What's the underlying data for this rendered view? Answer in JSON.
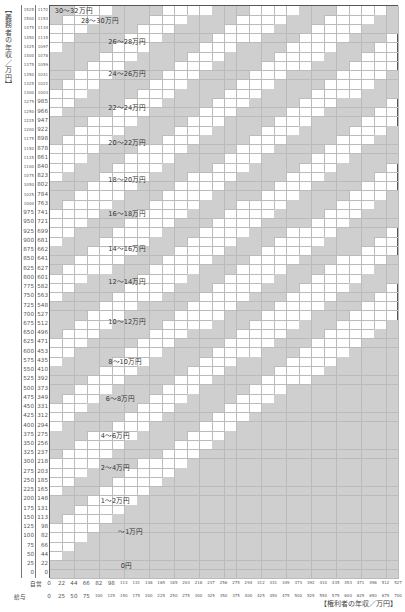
{
  "chart_data": {
    "type": "heatmap",
    "ylabel": "【義務者の年収／万円】",
    "xlabel": "【権利者の年収／万円】",
    "y_axis": {
      "salary_label": "給与",
      "self_employed_label": "自営",
      "salary_values": [
        2000,
        1975,
        1950,
        1925,
        1900,
        1875,
        1850,
        1825,
        1800,
        1775,
        1750,
        1725,
        1700,
        1675,
        1650,
        1625,
        1600,
        1575,
        1550,
        1525,
        1500,
        1475,
        1450,
        1425,
        1400,
        1375,
        1350,
        1325,
        1300,
        1275,
        1250,
        1225,
        1200,
        1175,
        1150,
        1125,
        1100,
        1075,
        1050,
        1025,
        1000,
        975,
        950,
        925,
        900,
        875,
        850,
        825,
        800,
        775,
        750,
        725,
        700,
        675,
        650,
        625,
        600,
        575,
        550,
        525,
        500,
        475,
        450,
        425,
        400,
        375,
        350,
        325,
        300,
        275,
        250,
        225,
        200,
        175,
        150,
        125,
        100,
        75,
        50,
        25,
        0
      ],
      "self_employed_values": [
        1567,
        1548,
        1530,
        1511,
        1492,
        1473,
        1455,
        1436,
        1417,
        1398,
        1379,
        1360,
        1342,
        1323,
        1304,
        1285,
        1266,
        1247,
        1229,
        1210,
        1191,
        1172,
        1153,
        1134,
        1115,
        1097,
        1078,
        1059,
        1041,
        1022,
        1003,
        985,
        966,
        947,
        922,
        898,
        878,
        861,
        840,
        823,
        802,
        784,
        763,
        741,
        721,
        699,
        681,
        662,
        641,
        627,
        601,
        582,
        563,
        548,
        527,
        512,
        496,
        471,
        453,
        435,
        410,
        392,
        373,
        349,
        331,
        312,
        294,
        275,
        256,
        237,
        218,
        203,
        185,
        165,
        148,
        131,
        113,
        98,
        82,
        66,
        44,
        22,
        0
      ]
    },
    "x_axis": {
      "self_employed_label": "自営",
      "salary_label": "給与",
      "self_employed_values": [
        0,
        22,
        44,
        66,
        82,
        98,
        113,
        131,
        148,
        165,
        185,
        203,
        218,
        237,
        256,
        275,
        294,
        312,
        331,
        349,
        373,
        392,
        410,
        435,
        453,
        471,
        496,
        512,
        527
      ],
      "salary_values": [
        0,
        25,
        50,
        75,
        100,
        125,
        150,
        175,
        200,
        225,
        250,
        275,
        300,
        325,
        350,
        375,
        400,
        425,
        450,
        475,
        500,
        525,
        550,
        575,
        600,
        625,
        650,
        675,
        700
      ]
    },
    "bands": [
      {
        "label": "0円"
      },
      {
        "label": "〜1万円"
      },
      {
        "label": "1〜2万円"
      },
      {
        "label": "2〜4万円"
      },
      {
        "label": "4〜6万円"
      },
      {
        "label": "6〜8万円"
      },
      {
        "label": "8〜10万円"
      },
      {
        "label": "10〜12万円"
      },
      {
        "label": "12〜14万円"
      },
      {
        "label": "14〜16万円"
      },
      {
        "label": "16〜18万円"
      },
      {
        "label": "18〜20万円"
      },
      {
        "label": "20〜22万円"
      },
      {
        "label": "22〜24万円"
      },
      {
        "label": "24〜26万円"
      },
      {
        "label": "26〜28万円"
      },
      {
        "label": "28〜30万円"
      },
      {
        "label": "30〜32万円"
      }
    ],
    "shading": {
      "band_color": "#cfcfcf",
      "alt_color": "#ffffff",
      "grid_line": "#bbbbbb"
    }
  },
  "labels": {
    "ylabel": "【義務者の年収／万円】",
    "xlabel": "【権利者の年収／万円】",
    "x_self_hdr": "自営",
    "x_salary_hdr": "給与"
  }
}
